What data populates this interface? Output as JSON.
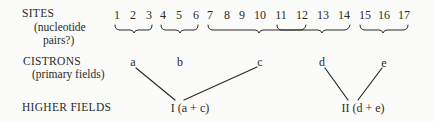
{
  "labels": {
    "sites": "SITES",
    "sites_sub1": "(nucleotide",
    "sites_sub2": "pairs?)",
    "cistrons": "CISTRONS",
    "cistrons_sub": "(primary fields)",
    "higher_fields": "HIGHER FIELDS"
  },
  "sites": [
    {
      "label": "1",
      "x": 117
    },
    {
      "label": "2",
      "x": 133
    },
    {
      "label": "3",
      "x": 149
    },
    {
      "label": "4",
      "x": 163
    },
    {
      "label": "5",
      "x": 179
    },
    {
      "label": "6",
      "x": 196
    },
    {
      "label": "7",
      "x": 210
    },
    {
      "label": "8",
      "x": 227
    },
    {
      "label": "9",
      "x": 242
    },
    {
      "label": "10",
      "x": 260
    },
    {
      "label": "11",
      "x": 281
    },
    {
      "label": "12",
      "x": 302
    },
    {
      "label": "13",
      "x": 323
    },
    {
      "label": "14",
      "x": 344
    },
    {
      "label": "15",
      "x": 365
    },
    {
      "label": "16",
      "x": 384
    },
    {
      "label": "17",
      "x": 404
    }
  ],
  "cistrons": [
    {
      "label": "a",
      "x": 133,
      "sites": "1-3"
    },
    {
      "label": "b",
      "x": 180,
      "sites": "4-6"
    },
    {
      "label": "c",
      "x": 260,
      "sites": "7-12"
    },
    {
      "label": "d",
      "x": 322,
      "sites": "11-14"
    },
    {
      "label": "e",
      "x": 384,
      "sites": "15-17"
    }
  ],
  "higher_fields": [
    {
      "label": "I (a + c)",
      "x": 190
    },
    {
      "label": "II (d + e)",
      "x": 363
    }
  ],
  "colors": {
    "ink": "#2a2a2a",
    "background": "#fbfbf9"
  }
}
